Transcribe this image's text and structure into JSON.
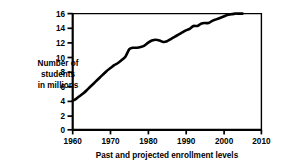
{
  "chart_data": {
    "type": "line",
    "title": "",
    "subtitle": "",
    "xlabel": "Past and projected enrollment levels",
    "ylabel": "Number of students in millions",
    "ylabel_lines": [
      "Number of",
      "students",
      "in millions"
    ],
    "xlim": [
      1960,
      2010
    ],
    "ylim": [
      0,
      16
    ],
    "xticks": [
      1960,
      1970,
      1980,
      1990,
      2000,
      2010
    ],
    "xtick_labels": [
      "1960",
      "1970",
      "1980",
      "1990",
      "2000",
      "2010"
    ],
    "yticks": [
      0,
      2,
      4,
      6,
      8,
      10,
      12,
      14,
      16
    ],
    "ytick_labels": [
      "0",
      "2",
      "4",
      "6",
      "8",
      "10",
      "12",
      "14",
      "16"
    ],
    "grid": false,
    "legend": null,
    "line_color": "#000000",
    "line_width": 2.6,
    "series": [
      {
        "name": "Number of students in millions",
        "x": [
          1960,
          1961,
          1962,
          1963,
          1964,
          1965,
          1966,
          1967,
          1968,
          1969,
          1970,
          1971,
          1972,
          1973,
          1974,
          1975,
          1976,
          1977,
          1978,
          1979,
          1980,
          1981,
          1982,
          1983,
          1984,
          1985,
          1986,
          1987,
          1988,
          1989,
          1990,
          1991,
          1992,
          1993,
          1994,
          1995,
          1996,
          1997,
          1998,
          1999,
          2000,
          2001,
          2002,
          2003,
          2004,
          2005
        ],
        "values": [
          4.0,
          4.3,
          4.7,
          5.1,
          5.6,
          6.1,
          6.6,
          7.1,
          7.6,
          8.1,
          8.5,
          8.9,
          9.2,
          9.6,
          10.1,
          11.1,
          11.3,
          11.3,
          11.4,
          11.6,
          12.0,
          12.3,
          12.4,
          12.3,
          12.1,
          12.2,
          12.5,
          12.8,
          13.1,
          13.4,
          13.7,
          13.9,
          14.3,
          14.3,
          14.6,
          14.7,
          14.7,
          15.0,
          15.2,
          15.4,
          15.6,
          15.8,
          15.9,
          16.0,
          16.0,
          16.0
        ]
      }
    ]
  },
  "axes": {
    "spine_color": "#000000",
    "background": "#ffffff"
  }
}
